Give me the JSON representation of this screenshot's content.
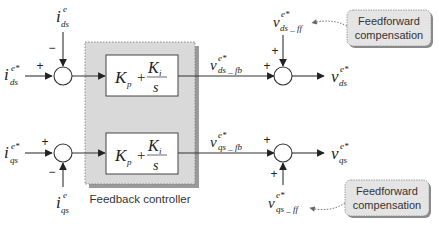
{
  "feedback_controller": {
    "label": "Feedback controller",
    "fill": "#d9d9d9",
    "shadow": "#9a9a9a"
  },
  "pi_block": {
    "kp": "K",
    "kp_sub": "p",
    "plus": "+",
    "ki": "K",
    "ki_sub": "i",
    "s": "s"
  },
  "d_axis": {
    "ref": {
      "main": "i",
      "sup": "e*",
      "sub": "ds"
    },
    "feedback": {
      "main": "i",
      "sup": "e",
      "sub": "ds"
    },
    "ref_sign": "+",
    "fb_sign": "−",
    "v_fb": {
      "main": "v",
      "sup": "e*",
      "sub": "ds _ fb"
    },
    "v_ff": {
      "main": "v",
      "sup": "e*",
      "sub": "ds _ ff"
    },
    "v_fb_sign": "+",
    "v_ff_sign": "+",
    "output": {
      "main": "v",
      "sup": "e*",
      "sub": "ds"
    }
  },
  "q_axis": {
    "ref": {
      "main": "i",
      "sup": "e*",
      "sub": "qs"
    },
    "feedback": {
      "main": "i",
      "sup": "e",
      "sub": "qs"
    },
    "ref_sign": "+",
    "fb_sign": "−",
    "v_fb": {
      "main": "v",
      "sup": "e*",
      "sub": "qs _ fb"
    },
    "v_ff": {
      "main": "v",
      "sup": "e*",
      "sub": "qs _ ff"
    },
    "v_fb_sign": "+",
    "v_ff_sign": "+",
    "output": {
      "main": "v",
      "sup": "e*",
      "sub": "qs"
    }
  },
  "callouts": [
    {
      "line1": "Feedforward",
      "line2": "compensation"
    },
    {
      "line1": "Feedforward",
      "line2": "compensation"
    }
  ],
  "colors": {
    "callout_fill": "#e4e4e4",
    "callout_border": "#8a8a8a",
    "line": "#333333"
  }
}
